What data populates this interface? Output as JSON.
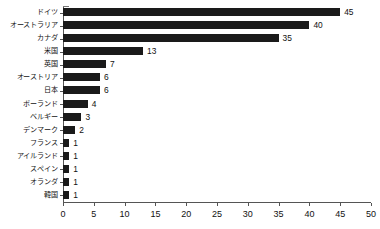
{
  "chart_data": {
    "type": "bar",
    "orientation": "horizontal",
    "title": "",
    "subtitle": "",
    "xlabel": "",
    "ylabel": "",
    "xlim": [
      0,
      50
    ],
    "xticks": [
      0,
      5,
      10,
      15,
      20,
      25,
      30,
      35,
      40,
      45,
      50
    ],
    "xtick_labels": [
      "0",
      "5",
      "10",
      "15",
      "20",
      "25",
      "30",
      "35",
      "40",
      "45",
      "50"
    ],
    "grid": false,
    "legend": false,
    "legend_position": "none",
    "bar_color": "#1a1a1a",
    "axis_color": "#555555",
    "show_value_labels": true,
    "categories": [
      "ドイツ",
      "オーストラリア",
      "カナダ",
      "米国",
      "英国",
      "オーストリア",
      "日本",
      "ポーランド",
      "ベルギー",
      "デンマーク",
      "フランス",
      "アイルランド",
      "スペイン",
      "オランダ",
      "韓国"
    ],
    "values": [
      45,
      40,
      35,
      13,
      7,
      6,
      6,
      4,
      3,
      2,
      1,
      1,
      1,
      1,
      1
    ],
    "value_labels": [
      "45",
      "40",
      "35",
      "13",
      "7",
      "6",
      "6",
      "4",
      "3",
      "2",
      "1",
      "1",
      "1",
      "1",
      "1"
    ]
  }
}
